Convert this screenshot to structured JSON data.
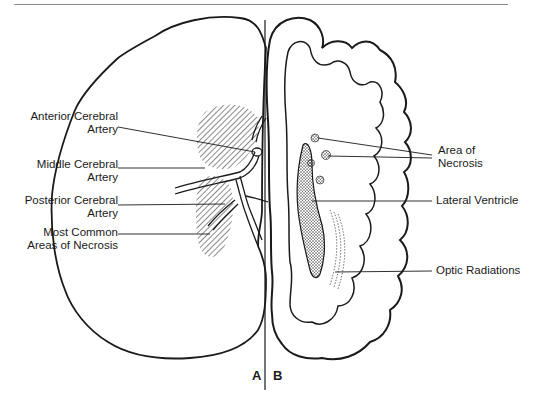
{
  "figure": {
    "panels": [
      {
        "id": "A",
        "label": "A",
        "description": "Left hemisphere outline with cerebral arteries and hatched areas of necrosis"
      },
      {
        "id": "B",
        "label": "B",
        "description": "Right hemisphere coronal section with gyri, lateral ventricle, areas of necrosis and optic radiations"
      }
    ],
    "left_labels": {
      "anterior_line1": "Anterior Cerebral",
      "anterior_line2": "Artery",
      "middle_line1": "Middle Cerebral",
      "middle_line2": "Artery",
      "posterior_line1": "Posterior Cerebral",
      "posterior_line2": "Artery",
      "necrosis_line1": "Most Common",
      "necrosis_line2": "Areas of Necrosis"
    },
    "right_labels": {
      "necrosis_line1": "Area of",
      "necrosis_line2": "Necrosis",
      "ventricle": "Lateral Ventricle",
      "optic": "Optic Radiations"
    },
    "colors": {
      "ink": "#1a1a1a",
      "rule": "#8a8a8a",
      "background": "#ffffff"
    }
  }
}
